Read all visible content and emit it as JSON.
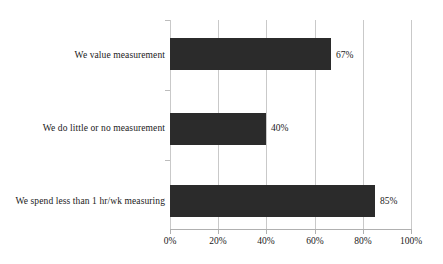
{
  "chart_data": {
    "type": "bar",
    "orientation": "horizontal",
    "title": "",
    "subtitle": "",
    "xlabel": "",
    "ylabel": "",
    "categories": [
      "We value measurement",
      "We do little or no measurement",
      "We spend less than 1 hr/wk measuring"
    ],
    "values": [
      67,
      40,
      85
    ],
    "data_labels": [
      "67%",
      "40%",
      "85%"
    ],
    "xticks": [
      0,
      20,
      40,
      60,
      80,
      100
    ],
    "xtick_labels": [
      "0%",
      "20%",
      "40%",
      "60%",
      "80%",
      "100%"
    ],
    "xlim": [
      0,
      100
    ],
    "grid": "vertical",
    "legend": "none",
    "bar_color": "#2b2b2b",
    "gridline_color": "#c9c9c9",
    "axis_color": "#b0b0b0",
    "text_color": "#1a1a1a",
    "background_color": "#ffffff"
  }
}
